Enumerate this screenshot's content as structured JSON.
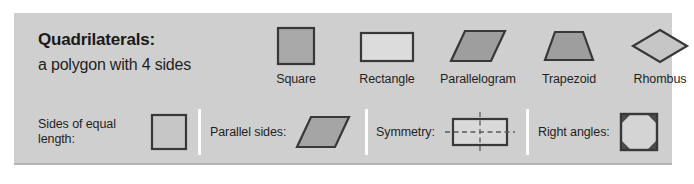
{
  "poster": {
    "definition": {
      "term": "Quadrilaterals:",
      "description": "a polygon with 4 sides"
    },
    "shapes": [
      {
        "name": "Square",
        "icon": "square-shape"
      },
      {
        "name": "Rectangle",
        "icon": "rectangle-shape"
      },
      {
        "name": "Parallelogram",
        "icon": "parallelogram-shape"
      },
      {
        "name": "Trapezoid",
        "icon": "trapezoid-shape"
      },
      {
        "name": "Rhombus",
        "icon": "rhombus-shape"
      }
    ],
    "properties": [
      {
        "label": "Sides of equal length:",
        "icon": "square-shape"
      },
      {
        "label": "Parallel sides:",
        "icon": "parallelogram-shape"
      },
      {
        "label": "Symmetry:",
        "icon": "symmetry-rectangle-shape"
      },
      {
        "label": "Right angles:",
        "icon": "right-angle-square-shape"
      }
    ],
    "colors": {
      "panel_background": "#cfcfcf",
      "shape_fill": "#a8a8a8",
      "shape_fill_light": "#c6c6c6",
      "shape_fill_pale": "#d9d9d9",
      "shape_stroke": "#383838",
      "divider": "#fdfdfd",
      "text": "#1f1f1f"
    }
  }
}
